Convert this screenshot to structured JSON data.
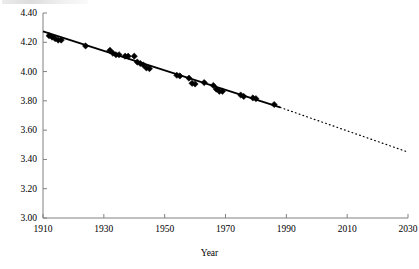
{
  "chart_data": {
    "type": "scatter",
    "title": "",
    "subtitle": "",
    "xlabel": "Year",
    "ylabel": "",
    "xlim": [
      1910,
      2030
    ],
    "ylim": [
      3.0,
      4.4
    ],
    "grid": false,
    "legend": null,
    "x_ticks": [
      1910,
      1930,
      1950,
      1970,
      1990,
      2010,
      2030
    ],
    "x_tick_labels": [
      "1910",
      "1930",
      "1950",
      "1970",
      "1990",
      "2010",
      "2030"
    ],
    "y_ticks": [
      3.0,
      3.2,
      3.4,
      3.6,
      3.8,
      4.0,
      4.2,
      4.4
    ],
    "y_tick_labels": [
      "3.00",
      "3.20",
      "3.40",
      "3.60",
      "3.80",
      "4.00",
      "4.20",
      "4.40"
    ],
    "marker": "diamond",
    "marker_color": "#000000",
    "series": [
      {
        "name": "observations",
        "type": "scatter",
        "points": [
          [
            1912,
            4.245
          ],
          [
            1913,
            4.235
          ],
          [
            1914,
            4.225
          ],
          [
            1915,
            4.215
          ],
          [
            1916,
            4.215
          ],
          [
            1924,
            4.175
          ],
          [
            1932,
            4.145
          ],
          [
            1933,
            4.125
          ],
          [
            1934,
            4.115
          ],
          [
            1935,
            4.115
          ],
          [
            1937,
            4.105
          ],
          [
            1938,
            4.105
          ],
          [
            1940,
            4.105
          ],
          [
            1941,
            4.065
          ],
          [
            1942,
            4.055
          ],
          [
            1943,
            4.045
          ],
          [
            1944,
            4.025
          ],
          [
            1945,
            4.02
          ],
          [
            1954,
            3.975
          ],
          [
            1955,
            3.97
          ],
          [
            1958,
            3.955
          ],
          [
            1959,
            3.92
          ],
          [
            1960,
            3.915
          ],
          [
            1963,
            3.925
          ],
          [
            1966,
            3.905
          ],
          [
            1967,
            3.88
          ],
          [
            1968,
            3.865
          ],
          [
            1969,
            3.865
          ],
          [
            1975,
            3.84
          ],
          [
            1976,
            3.83
          ],
          [
            1979,
            3.82
          ],
          [
            1980,
            3.815
          ],
          [
            1986,
            3.775
          ]
        ]
      },
      {
        "name": "fitted-trend",
        "type": "line",
        "style": "solid",
        "points": [
          [
            1910,
            4.275
          ],
          [
            1988,
            3.755
          ]
        ]
      },
      {
        "name": "extrapolated-trend",
        "type": "line",
        "style": "dotted",
        "points": [
          [
            1988,
            3.755
          ],
          [
            2030,
            3.45
          ]
        ]
      }
    ]
  },
  "axes": {
    "x_title": "Year"
  }
}
